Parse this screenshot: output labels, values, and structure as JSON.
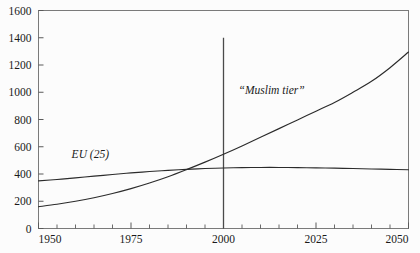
{
  "chart_data": {
    "type": "line",
    "title": "",
    "subtitle": "",
    "xlabel": "",
    "ylabel": "",
    "xlim": [
      1950,
      2050
    ],
    "ylim": [
      0,
      1600
    ],
    "grid": false,
    "legend_position": "inline-annotation",
    "x_ticks": [
      1950,
      1975,
      2000,
      2025,
      2050
    ],
    "x_tick_labels": [
      "1950",
      "1975",
      "2000",
      "2025",
      "2050"
    ],
    "x_minor_tick_step": 5,
    "y_ticks": [
      0,
      200,
      400,
      600,
      800,
      1000,
      1200,
      1400,
      1600
    ],
    "y_tick_labels": [
      "0",
      "200",
      "400",
      "600",
      "800",
      "1000",
      "1200",
      "1400",
      "1600"
    ],
    "series": [
      {
        "name": "EU (25)",
        "label": "EU (25)",
        "color": "#2b2b2b",
        "x": [
          1950,
          1955,
          1960,
          1965,
          1970,
          1975,
          1980,
          1985,
          1990,
          1995,
          2000,
          2005,
          2010,
          2015,
          2020,
          2025,
          2030,
          2035,
          2040,
          2045,
          2050
        ],
        "values": [
          350,
          360,
          372,
          384,
          396,
          408,
          418,
          427,
          434,
          440,
          444,
          447,
          448,
          448,
          447,
          445,
          443,
          440,
          437,
          434,
          431
        ]
      },
      {
        "name": "Muslim tier",
        "label": "“Muslim tier”",
        "color": "#2b2b2b",
        "x": [
          1950,
          1955,
          1960,
          1965,
          1970,
          1975,
          1980,
          1985,
          1990,
          1995,
          2000,
          2005,
          2010,
          2015,
          2020,
          2025,
          2030,
          2035,
          2040,
          2045,
          2050
        ],
        "values": [
          160,
          178,
          200,
          226,
          257,
          293,
          334,
          380,
          432,
          487,
          545,
          606,
          669,
          733,
          797,
          861,
          925,
          1000,
          1080,
          1180,
          1295
        ]
      }
    ],
    "annotations": [
      {
        "name": "year-2000-marker",
        "type": "vline",
        "x": 2000,
        "y_from": 0,
        "y_to": 1400
      }
    ],
    "series_label_positions": [
      {
        "name": "EU (25)",
        "x": 1964,
        "y": 520
      },
      {
        "name": "“Muslim tier”",
        "x": 2013,
        "y": 990
      }
    ]
  }
}
